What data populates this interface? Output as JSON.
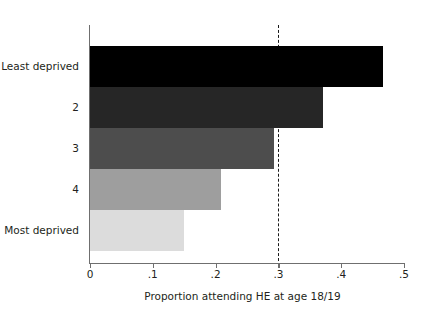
{
  "chart_data": {
    "type": "bar",
    "orientation": "horizontal",
    "title": "",
    "subtitle": "",
    "xlabel": "Proportion attending HE at age 18/19",
    "ylabel": "",
    "categories": [
      "Least deprived",
      "2",
      "3",
      "4",
      "Most deprived"
    ],
    "values": [
      0.467,
      0.371,
      0.293,
      0.209,
      0.15
    ],
    "bar_colors": [
      "#000000",
      "#262626",
      "#4d4d4d",
      "#9e9e9e",
      "#dcdcdc"
    ],
    "xlim": [
      0,
      0.5
    ],
    "xticks": [
      0,
      0.1,
      0.2,
      0.3,
      0.4,
      0.5
    ],
    "xtick_labels": [
      "0",
      ".1",
      ".2",
      ".3",
      ".4",
      ".5"
    ],
    "grid": false,
    "legend": null,
    "annotations": [
      {
        "name": "reference-line",
        "type": "vline",
        "value": 0.3,
        "style": "dashed",
        "color": "#1a1a1a"
      }
    ]
  },
  "axis": {
    "line_color": "#6f6f6f",
    "text_color": "#231f20"
  }
}
